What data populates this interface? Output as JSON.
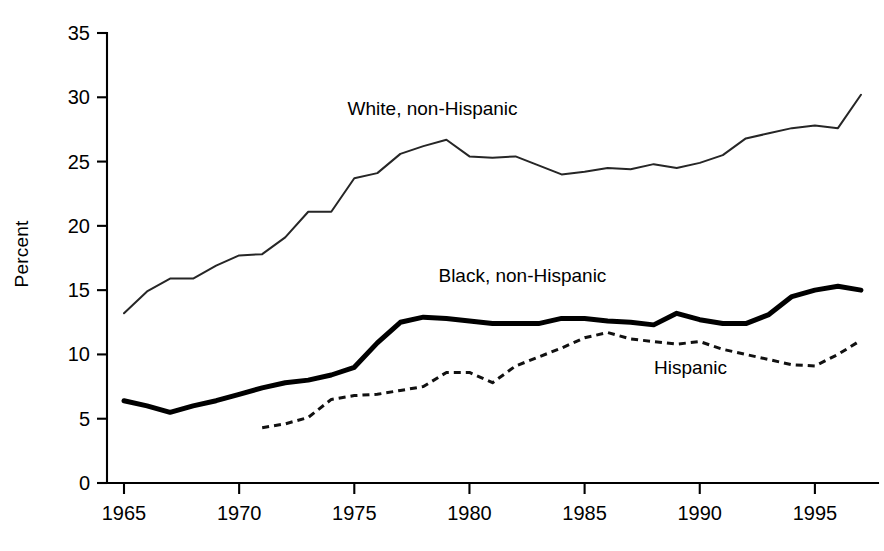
{
  "chart_data": {
    "type": "line",
    "title": "",
    "xlabel": "",
    "ylabel": "Percent",
    "xlim": [
      1964.3,
      1997.6
    ],
    "ylim": [
      0,
      35
    ],
    "grid": false,
    "legend": "inline-labels",
    "yticks": [
      0,
      5,
      10,
      15,
      20,
      25,
      30,
      35
    ],
    "ytick_labels": [
      "0",
      "5",
      "10",
      "15",
      "20",
      "25",
      "30",
      "35"
    ],
    "xticks": [
      1965,
      1970,
      1975,
      1980,
      1985,
      1990,
      1995
    ],
    "xtick_labels": [
      "1965",
      "1970",
      "1975",
      "1980",
      "1985",
      "1990",
      "1995"
    ],
    "series": [
      {
        "name": "White, non-Hispanic",
        "style": "thin-solid",
        "label_x": 1978.4,
        "label_y": 28.6,
        "x": [
          1965,
          1966,
          1967,
          1968,
          1969,
          1970,
          1971,
          1972,
          1973,
          1974,
          1975,
          1976,
          1977,
          1978,
          1979,
          1980,
          1981,
          1982,
          1983,
          1984,
          1985,
          1986,
          1987,
          1988,
          1989,
          1990,
          1991,
          1992,
          1993,
          1994,
          1995,
          1996,
          1997
        ],
        "y": [
          13.2,
          14.9,
          15.9,
          15.9,
          16.9,
          17.7,
          17.8,
          19.1,
          21.1,
          21.1,
          23.7,
          24.1,
          25.6,
          26.2,
          26.7,
          25.4,
          25.3,
          25.4,
          24.7,
          24.0,
          24.2,
          24.5,
          24.4,
          24.8,
          24.5,
          24.9,
          25.5,
          26.8,
          27.2,
          27.6,
          27.8,
          27.6,
          30.2
        ]
      },
      {
        "name": "Black, non-Hispanic",
        "style": "bold-solid",
        "label_x": 1982.3,
        "label_y": 15.6,
        "x": [
          1965,
          1966,
          1967,
          1968,
          1969,
          1970,
          1971,
          1972,
          1973,
          1974,
          1975,
          1976,
          1977,
          1978,
          1979,
          1980,
          1981,
          1982,
          1983,
          1984,
          1985,
          1986,
          1987,
          1988,
          1989,
          1990,
          1991,
          1992,
          1993,
          1994,
          1995,
          1996,
          1997
        ],
        "y": [
          6.4,
          6.0,
          5.5,
          6.0,
          6.4,
          6.9,
          7.4,
          7.8,
          8.0,
          8.4,
          9.0,
          10.9,
          12.5,
          12.9,
          12.8,
          12.6,
          12.4,
          12.4,
          12.4,
          12.8,
          12.8,
          12.6,
          12.5,
          12.3,
          13.2,
          12.7,
          12.4,
          12.4,
          13.1,
          14.5,
          15.0,
          15.3,
          15.0
        ]
      },
      {
        "name": "Hispanic",
        "style": "dashed",
        "label_x": 1989.6,
        "label_y": 8.5,
        "x": [
          1971,
          1972,
          1973,
          1974,
          1975,
          1976,
          1977,
          1978,
          1979,
          1980,
          1981,
          1982,
          1983,
          1984,
          1985,
          1986,
          1987,
          1988,
          1989,
          1990,
          1991,
          1992,
          1993,
          1994,
          1995,
          1996,
          1997
        ],
        "y": [
          4.3,
          4.6,
          5.1,
          6.5,
          6.8,
          6.9,
          7.2,
          7.5,
          8.6,
          8.6,
          7.8,
          9.1,
          9.8,
          10.5,
          11.3,
          11.7,
          11.2,
          11.0,
          10.8,
          11.0,
          10.4,
          10.0,
          9.6,
          9.2,
          9.1,
          10.0,
          11.1
        ]
      }
    ]
  },
  "axis": {
    "y_axis_title": "Percent"
  }
}
